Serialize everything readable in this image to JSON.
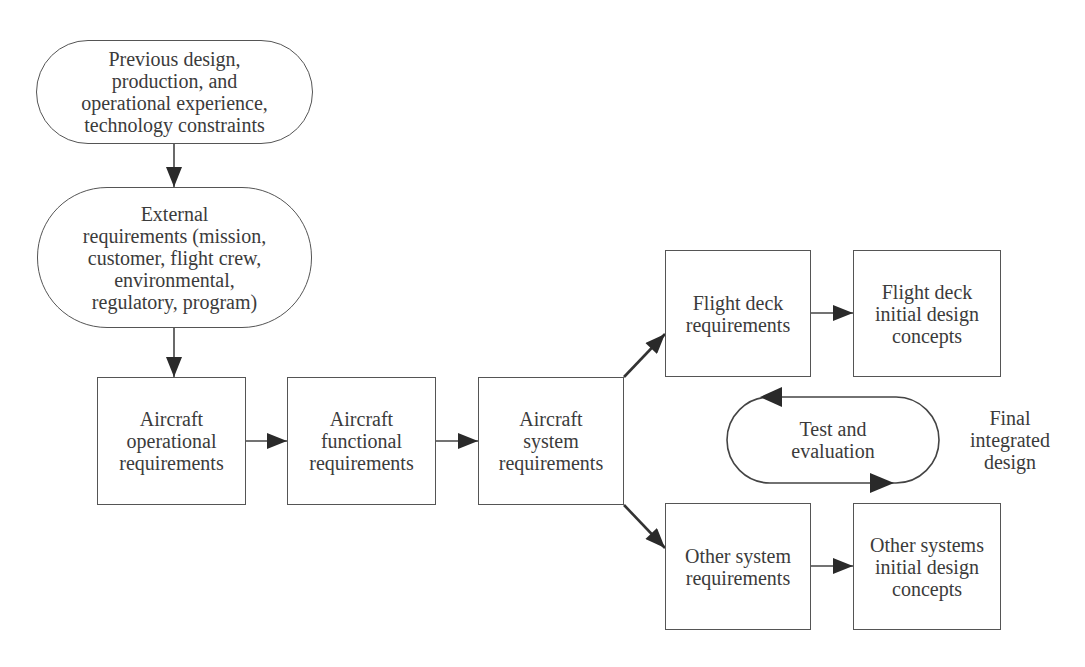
{
  "diagram": {
    "type": "flowchart",
    "nodes": {
      "previous_design": {
        "label": "Previous design,\nproduction, and\noperational experience,\ntechnology constraints",
        "shape": "stadium"
      },
      "external_requirements": {
        "label": "External\nrequirements (mission,\ncustomer, flight crew,\nenvironmental,\nregulatory, program)",
        "shape": "stadium"
      },
      "aircraft_operational": {
        "label": "Aircraft\noperational\nrequirements",
        "shape": "rectangle"
      },
      "aircraft_functional": {
        "label": "Aircraft\nfunctional\nrequirements",
        "shape": "rectangle"
      },
      "aircraft_system": {
        "label": "Aircraft\nsystem\nrequirements",
        "shape": "rectangle"
      },
      "flight_deck_requirements": {
        "label": "Flight deck\nrequirements",
        "shape": "rectangle"
      },
      "flight_deck_initial": {
        "label": "Flight deck\ninitial design\nconcepts",
        "shape": "rectangle"
      },
      "other_system_requirements": {
        "label": "Other system\nrequirements",
        "shape": "rectangle"
      },
      "other_systems_initial": {
        "label": "Other systems\ninitial design\nconcepts",
        "shape": "rectangle"
      },
      "test_evaluation": {
        "label": "Test and\nevaluation",
        "shape": "cycle-loop"
      },
      "final_design": {
        "label": "Final\nintegrated\ndesign",
        "shape": "text"
      }
    },
    "edges": [
      {
        "from": "previous_design",
        "to": "external_requirements"
      },
      {
        "from": "external_requirements",
        "to": "aircraft_operational"
      },
      {
        "from": "aircraft_operational",
        "to": "aircraft_functional"
      },
      {
        "from": "aircraft_functional",
        "to": "aircraft_system"
      },
      {
        "from": "aircraft_system",
        "to": "flight_deck_requirements"
      },
      {
        "from": "aircraft_system",
        "to": "other_system_requirements"
      },
      {
        "from": "flight_deck_requirements",
        "to": "flight_deck_initial"
      },
      {
        "from": "other_system_requirements",
        "to": "other_systems_initial"
      }
    ],
    "colors": {
      "stroke": "#555555",
      "arrow_fill": "#2a2a2a",
      "text": "#3b3b3b",
      "background": "#ffffff"
    }
  }
}
